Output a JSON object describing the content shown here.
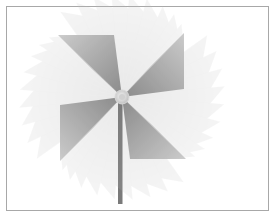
{
  "image": {
    "subject": "pinwheel",
    "description": "Grey monochrome pinwheel with motion-blur ghost blades and a stick",
    "colors": {
      "frame_border": "#a8a8a8",
      "background": "#ffffff",
      "blade_dark": "#6e6e6e",
      "blade_mid": "#9a9a9a",
      "blade_light": "#cfcfcf",
      "hub": "#e6e6e6",
      "stick": "#7a7a7a"
    },
    "blade_count": 4,
    "ghost_copies": 9
  }
}
